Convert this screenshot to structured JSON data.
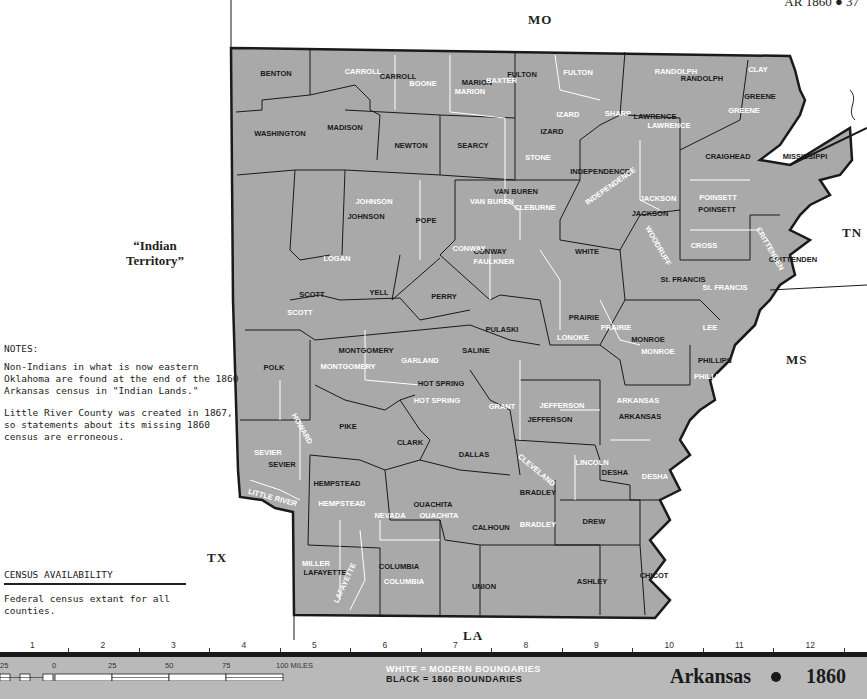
{
  "header": {
    "page_ref": "AR 1860 ● 37"
  },
  "map": {
    "title": "Arkansas",
    "year": "1860",
    "fill_color": "#a9a9a9",
    "border_color": "#1a1a1a",
    "modern_boundary_color": "#ffffff",
    "neighbors": {
      "north": "MO",
      "east_tn": "TN",
      "east_ms": "MS",
      "south": "LA",
      "southwest": "TX",
      "west_line1": "“Indian",
      "west_line2": "Territory”"
    },
    "counties_1860": [
      {
        "name": "BENTON",
        "x": 276,
        "y": 76
      },
      {
        "name": "CARROLL",
        "x": 398,
        "y": 79
      },
      {
        "name": "MARION",
        "x": 477,
        "y": 85
      },
      {
        "name": "FULTON",
        "x": 522,
        "y": 77
      },
      {
        "name": "RANDOLPH",
        "x": 702,
        "y": 81
      },
      {
        "name": "GREENE",
        "x": 760,
        "y": 99
      },
      {
        "name": "WASHINGTON",
        "x": 280,
        "y": 136
      },
      {
        "name": "MADISON",
        "x": 345,
        "y": 130
      },
      {
        "name": "NEWTON",
        "x": 411,
        "y": 148
      },
      {
        "name": "SEARCY",
        "x": 473,
        "y": 148
      },
      {
        "name": "IZARD",
        "x": 552,
        "y": 134
      },
      {
        "name": "LAWRENCE",
        "x": 655,
        "y": 119
      },
      {
        "name": "CRAIGHEAD",
        "x": 728,
        "y": 159
      },
      {
        "name": "MISSISSIPPI",
        "x": 805,
        "y": 159
      },
      {
        "name": "INDEPENDENCE",
        "x": 600,
        "y": 174
      },
      {
        "name": "VAN BUREN",
        "x": 516,
        "y": 194
      },
      {
        "name": "JOHNSON",
        "x": 366,
        "y": 219
      },
      {
        "name": "POPE",
        "x": 426,
        "y": 223
      },
      {
        "name": "JACKSON",
        "x": 650,
        "y": 216
      },
      {
        "name": "POINSETT",
        "x": 717,
        "y": 212
      },
      {
        "name": "CONWAY",
        "x": 490,
        "y": 254
      },
      {
        "name": "WHITE",
        "x": 587,
        "y": 254
      },
      {
        "name": "CRITTENDEN",
        "x": 793,
        "y": 262
      },
      {
        "name": "SCOTT",
        "x": 312,
        "y": 297
      },
      {
        "name": "YELL",
        "x": 379,
        "y": 295
      },
      {
        "name": "PERRY",
        "x": 444,
        "y": 299
      },
      {
        "name": "St. FRANCIS",
        "x": 683,
        "y": 282
      },
      {
        "name": "PULASKI",
        "x": 502,
        "y": 332
      },
      {
        "name": "PRAIRIE",
        "x": 584,
        "y": 320
      },
      {
        "name": "MONTGOMERY",
        "x": 366,
        "y": 353
      },
      {
        "name": "SALINE",
        "x": 476,
        "y": 353
      },
      {
        "name": "MONROE",
        "x": 648,
        "y": 342
      },
      {
        "name": "POLK",
        "x": 274,
        "y": 370
      },
      {
        "name": "PHILLIPS",
        "x": 715,
        "y": 363
      },
      {
        "name": "HOT SPRING",
        "x": 441,
        "y": 386
      },
      {
        "name": "ARKANSAS",
        "x": 640,
        "y": 419
      },
      {
        "name": "JEFFERSON",
        "x": 550,
        "y": 422
      },
      {
        "name": "PIKE",
        "x": 348,
        "y": 429
      },
      {
        "name": "CLARK",
        "x": 410,
        "y": 445
      },
      {
        "name": "DALLAS",
        "x": 474,
        "y": 457
      },
      {
        "name": "SEVIER",
        "x": 282,
        "y": 467
      },
      {
        "name": "DESHA",
        "x": 615,
        "y": 475
      },
      {
        "name": "HEMPSTEAD",
        "x": 337,
        "y": 486
      },
      {
        "name": "BRADLEY",
        "x": 538,
        "y": 495
      },
      {
        "name": "OUACHITA",
        "x": 433,
        "y": 507
      },
      {
        "name": "CALHOUN",
        "x": 491,
        "y": 530
      },
      {
        "name": "DREW",
        "x": 594,
        "y": 524
      },
      {
        "name": "LAFAYETTE",
        "x": 325,
        "y": 575
      },
      {
        "name": "COLUMBIA",
        "x": 399,
        "y": 569
      },
      {
        "name": "CHICOT",
        "x": 654,
        "y": 578
      },
      {
        "name": "UNION",
        "x": 484,
        "y": 589
      },
      {
        "name": "ASHLEY",
        "x": 592,
        "y": 584
      }
    ],
    "counties_modern": [
      {
        "name": "CARROLL",
        "x": 363,
        "y": 74
      },
      {
        "name": "BOONE",
        "x": 423,
        "y": 86
      },
      {
        "name": "BAXTER",
        "x": 517,
        "y": 83,
        "anchor": "end"
      },
      {
        "name": "MARION",
        "x": 470,
        "y": 94
      },
      {
        "name": "FULTON",
        "x": 578,
        "y": 75
      },
      {
        "name": "RANDOLPH",
        "x": 676,
        "y": 74
      },
      {
        "name": "CLAY",
        "x": 758,
        "y": 72
      },
      {
        "name": "GREENE",
        "x": 744,
        "y": 113
      },
      {
        "name": "IZARD",
        "x": 568,
        "y": 117
      },
      {
        "name": "SHARP",
        "x": 618,
        "y": 116
      },
      {
        "name": "LAWRENCE",
        "x": 669,
        "y": 128
      },
      {
        "name": "STONE",
        "x": 538,
        "y": 160
      },
      {
        "name": "INDEPENDENCE",
        "x": 612,
        "y": 188,
        "rotate": -35
      },
      {
        "name": "JOHNSON",
        "x": 374,
        "y": 204
      },
      {
        "name": "VAN BUREN",
        "x": 492,
        "y": 204
      },
      {
        "name": "CLEBURNE",
        "x": 535,
        "y": 210
      },
      {
        "name": "POINSETT",
        "x": 718,
        "y": 200
      },
      {
        "name": "JACKSON",
        "x": 658,
        "y": 201
      },
      {
        "name": "CONWAY",
        "x": 469,
        "y": 251
      },
      {
        "name": "FAULKNER",
        "x": 494,
        "y": 264
      },
      {
        "name": "CROSS",
        "x": 704,
        "y": 248
      },
      {
        "name": "CRITTENDEN",
        "x": 768,
        "y": 250,
        "rotate": 60
      },
      {
        "name": "LOGAN",
        "x": 337,
        "y": 261
      },
      {
        "name": "SCOTT",
        "x": 300,
        "y": 315
      },
      {
        "name": "St. FRANCIS",
        "x": 725,
        "y": 290
      },
      {
        "name": "WOODRUFF",
        "x": 656,
        "y": 247,
        "rotate": 60
      },
      {
        "name": "LONOKE",
        "x": 573,
        "y": 340
      },
      {
        "name": "PRAIRIE",
        "x": 616,
        "y": 330
      },
      {
        "name": "LEE",
        "x": 710,
        "y": 330
      },
      {
        "name": "GARLAND",
        "x": 420,
        "y": 363
      },
      {
        "name": "MONTGOMERY",
        "x": 348,
        "y": 369
      },
      {
        "name": "MONROE",
        "x": 658,
        "y": 354
      },
      {
        "name": "PHILLIPS",
        "x": 711,
        "y": 379
      },
      {
        "name": "HOT SPRING",
        "x": 437,
        "y": 403
      },
      {
        "name": "ARKANSAS",
        "x": 638,
        "y": 403
      },
      {
        "name": "JEFFERSON",
        "x": 562,
        "y": 408
      },
      {
        "name": "GRANT",
        "x": 502,
        "y": 409
      },
      {
        "name": "HOWARD",
        "x": 300,
        "y": 430,
        "rotate": 60
      },
      {
        "name": "SEVIER",
        "x": 268,
        "y": 455
      },
      {
        "name": "LINCOLN",
        "x": 592,
        "y": 465
      },
      {
        "name": "CLEVELAND",
        "x": 535,
        "y": 472,
        "rotate": 40
      },
      {
        "name": "DESHA",
        "x": 655,
        "y": 479
      },
      {
        "name": "LITTLE RIVER",
        "x": 272,
        "y": 500,
        "rotate": 15
      },
      {
        "name": "HEMPSTEAD",
        "x": 342,
        "y": 506
      },
      {
        "name": "NEVADA",
        "x": 390,
        "y": 518
      },
      {
        "name": "OUACHITA",
        "x": 439,
        "y": 518
      },
      {
        "name": "BRADLEY",
        "x": 538,
        "y": 527
      },
      {
        "name": "MILLER",
        "x": 316,
        "y": 566
      },
      {
        "name": "LAFAYETTE",
        "x": 347,
        "y": 584,
        "rotate": -65
      },
      {
        "name": "COLUMBIA",
        "x": 404,
        "y": 584
      }
    ]
  },
  "notes": {
    "title": "NOTES:",
    "paragraphs": [
      "Non-Indians in what is now eastern Oklahoma are found at the end of the 1860 Arkansas census in \"Indian Lands.\"",
      "Little River County was created in 1867, so statements about its missing 1860 census are erroneous."
    ]
  },
  "census_availability": {
    "heading": "CENSUS AVAILABILITY",
    "text": "Federal census extant for all counties."
  },
  "ruler": {
    "ticks": [
      "1",
      "2",
      "3",
      "4",
      "5",
      "6",
      "7",
      "8",
      "9",
      "10",
      "11",
      "12"
    ]
  },
  "footer": {
    "scale_labels": [
      "25",
      "0",
      "25",
      "50",
      "75",
      "100 MILES"
    ],
    "legend_white": "WHITE = MODERN BOUNDARIES",
    "legend_black": "BLACK = 1860 BOUNDARIES",
    "title": "Arkansas",
    "year": "1860"
  }
}
